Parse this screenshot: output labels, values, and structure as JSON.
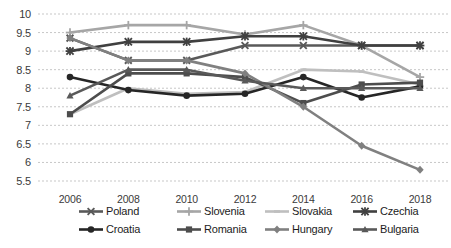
{
  "chart_data": {
    "type": "line",
    "title": "",
    "xlabel": "",
    "ylabel": "",
    "x": [
      2006,
      2008,
      2010,
      2012,
      2014,
      2016,
      2018
    ],
    "categories": [
      "2006",
      "2008",
      "2010",
      "2012",
      "2014",
      "2016",
      "2018"
    ],
    "ylim": [
      5.5,
      10.0
    ],
    "ytick_labels": [
      "10",
      "9.5",
      "9",
      "8.5",
      "8",
      "7.5",
      "7",
      "6.5",
      "6",
      "5.5"
    ],
    "yticks": [
      10,
      9.5,
      9,
      8.5,
      8,
      7.5,
      7,
      6.5,
      6,
      5.5
    ],
    "grid": true,
    "grid_style": "dotted-horizontal",
    "legend_position": "bottom",
    "series": [
      {
        "name": "Poland",
        "marker": "cross-x",
        "color": "#595959",
        "values": [
          9.35,
          8.75,
          8.75,
          9.15,
          9.15,
          9.15,
          9.15
        ]
      },
      {
        "name": "Slovenia",
        "marker": "plus",
        "color": "#a6a6a6",
        "values": [
          9.5,
          9.7,
          9.7,
          9.45,
          9.7,
          9.15,
          8.3
        ]
      },
      {
        "name": "Slovakia",
        "marker": "line",
        "color": "#bfbfbf",
        "values": [
          7.3,
          8.0,
          7.85,
          7.9,
          8.5,
          8.45,
          8.1
        ]
      },
      {
        "name": "Czechia",
        "marker": "star",
        "color": "#404040",
        "values": [
          9.0,
          9.25,
          9.25,
          9.4,
          9.4,
          9.15,
          9.15
        ]
      },
      {
        "name": "Croatia",
        "marker": "circle",
        "color": "#262626",
        "values": [
          8.3,
          7.95,
          7.8,
          7.85,
          8.3,
          7.75,
          8.05
        ]
      },
      {
        "name": "Romania",
        "marker": "square",
        "color": "#4d4d4d",
        "values": [
          7.3,
          8.4,
          8.4,
          8.3,
          7.6,
          8.1,
          8.15
        ]
      },
      {
        "name": "Hungary",
        "marker": "diamond",
        "color": "#808080",
        "values": [
          9.35,
          8.75,
          8.75,
          8.4,
          7.5,
          6.45,
          5.8
        ]
      },
      {
        "name": "Bulgaria",
        "marker": "triangle",
        "color": "#595959",
        "values": [
          7.8,
          8.5,
          8.5,
          8.2,
          8.0,
          8.0,
          8.0
        ]
      }
    ]
  },
  "legend": {
    "items": [
      {
        "label": "Poland"
      },
      {
        "label": "Slovenia"
      },
      {
        "label": "Slovakia"
      },
      {
        "label": "Czechia"
      },
      {
        "label": "Croatia"
      },
      {
        "label": "Romania"
      },
      {
        "label": "Hungary"
      },
      {
        "label": "Bulgaria"
      }
    ]
  },
  "caption": {
    "text": ""
  }
}
